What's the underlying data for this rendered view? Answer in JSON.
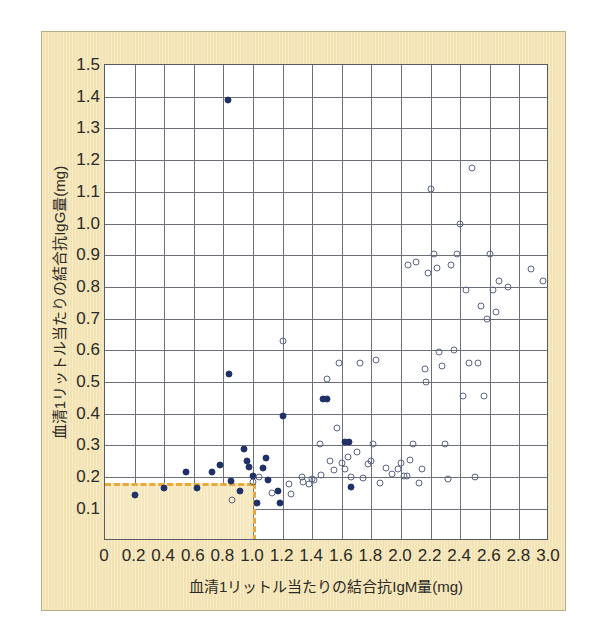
{
  "chart_data": {
    "type": "scatter",
    "title": "",
    "xlabel": "血清1リットル当たりの結合抗IgM量(mg)",
    "ylabel": "血清1リットル当たりの結合抗IgG量(mg)",
    "xlim": [
      0.0,
      3.0
    ],
    "ylim": [
      0.0,
      1.5
    ],
    "xticks": [
      "0",
      "0.2",
      "0.4",
      "0.6",
      "0.8",
      "1.0",
      "1.2",
      "1.4",
      "1.6",
      "1.8",
      "2.0",
      "2.2",
      "2.4",
      "2.6",
      "2.8",
      "3.0"
    ],
    "xtick_values": [
      0.0,
      0.2,
      0.4,
      0.6,
      0.8,
      1.0,
      1.2,
      1.4,
      1.6,
      1.8,
      2.0,
      2.2,
      2.4,
      2.6,
      2.8,
      3.0
    ],
    "yticks": [
      "0.1",
      "0.2",
      "0.3",
      "0.4",
      "0.5",
      "0.6",
      "0.7",
      "0.8",
      "0.9",
      "1.0",
      "1.1",
      "1.2",
      "1.3",
      "1.4",
      "1.5"
    ],
    "ytick_values": [
      0.1,
      0.2,
      0.3,
      0.4,
      0.5,
      0.6,
      0.7,
      0.8,
      0.9,
      1.0,
      1.1,
      1.2,
      1.3,
      1.4,
      1.5
    ],
    "grid": true,
    "grid_color": "#6b7078",
    "plot_bgcolor": "#ffffff",
    "paper_bgcolor": "#f4e3b2",
    "legend": [],
    "annotations": {
      "threshold_region": {
        "x_max": 1.0,
        "y_max": 0.18,
        "line_color": "#e8a93a",
        "fill_color": "#f6e6bb",
        "line_style": "dashed"
      }
    },
    "series": [
      {
        "name": "filled",
        "marker": "filled-circle",
        "color": "#1f3168",
        "points": [
          [
            0.2,
            0.145
          ],
          [
            0.4,
            0.165
          ],
          [
            0.55,
            0.215
          ],
          [
            0.62,
            0.165
          ],
          [
            0.72,
            0.215
          ],
          [
            0.78,
            0.237
          ],
          [
            0.83,
            1.39
          ],
          [
            0.84,
            0.525
          ],
          [
            0.85,
            0.188
          ],
          [
            0.91,
            0.155
          ],
          [
            0.94,
            0.29
          ],
          [
            0.96,
            0.25
          ],
          [
            0.97,
            0.232
          ],
          [
            1.0,
            0.205
          ],
          [
            1.03,
            0.118
          ],
          [
            1.07,
            0.228
          ],
          [
            1.09,
            0.26
          ],
          [
            1.1,
            0.192
          ],
          [
            1.17,
            0.155
          ],
          [
            1.18,
            0.118
          ],
          [
            1.2,
            0.392
          ],
          [
            1.47,
            0.445
          ],
          [
            1.5,
            0.445
          ],
          [
            1.62,
            0.312
          ],
          [
            1.65,
            0.312
          ],
          [
            1.66,
            0.168
          ]
        ]
      },
      {
        "name": "open",
        "marker": "open-circle",
        "color": "#5a6285",
        "points": [
          [
            0.86,
            0.128
          ],
          [
            1.0,
            0.185
          ],
          [
            1.04,
            0.2
          ],
          [
            1.13,
            0.15
          ],
          [
            1.2,
            0.63
          ],
          [
            1.24,
            0.178
          ],
          [
            1.26,
            0.148
          ],
          [
            1.33,
            0.2
          ],
          [
            1.34,
            0.185
          ],
          [
            1.38,
            0.178
          ],
          [
            1.4,
            0.195
          ],
          [
            1.41,
            0.19
          ],
          [
            1.45,
            0.305
          ],
          [
            1.46,
            0.208
          ],
          [
            1.5,
            0.508
          ],
          [
            1.52,
            0.252
          ],
          [
            1.55,
            0.222
          ],
          [
            1.57,
            0.355
          ],
          [
            1.58,
            0.56
          ],
          [
            1.6,
            0.245
          ],
          [
            1.62,
            0.225
          ],
          [
            1.64,
            0.262
          ],
          [
            1.66,
            0.2
          ],
          [
            1.7,
            0.278
          ],
          [
            1.72,
            0.56
          ],
          [
            1.74,
            0.198
          ],
          [
            1.78,
            0.24
          ],
          [
            1.8,
            0.252
          ],
          [
            1.81,
            0.305
          ],
          [
            1.83,
            0.57
          ],
          [
            1.86,
            0.182
          ],
          [
            1.9,
            0.23
          ],
          [
            1.94,
            0.21
          ],
          [
            1.98,
            0.225
          ],
          [
            2.0,
            0.245
          ],
          [
            2.02,
            0.205
          ],
          [
            2.04,
            0.202
          ],
          [
            2.05,
            0.87
          ],
          [
            2.06,
            0.255
          ],
          [
            2.08,
            0.305
          ],
          [
            2.1,
            0.88
          ],
          [
            2.12,
            0.182
          ],
          [
            2.14,
            0.225
          ],
          [
            2.16,
            0.54
          ],
          [
            2.17,
            0.5
          ],
          [
            2.18,
            0.845
          ],
          [
            2.2,
            1.11
          ],
          [
            2.22,
            0.905
          ],
          [
            2.24,
            0.86
          ],
          [
            2.26,
            0.595
          ],
          [
            2.28,
            0.55
          ],
          [
            2.3,
            0.305
          ],
          [
            2.32,
            0.195
          ],
          [
            2.34,
            0.87
          ],
          [
            2.36,
            0.6
          ],
          [
            2.38,
            0.905
          ],
          [
            2.4,
            1.0
          ],
          [
            2.42,
            0.455
          ],
          [
            2.44,
            0.79
          ],
          [
            2.46,
            0.56
          ],
          [
            2.48,
            1.175
          ],
          [
            2.5,
            0.2
          ],
          [
            2.52,
            0.56
          ],
          [
            2.54,
            0.74
          ],
          [
            2.56,
            0.455
          ],
          [
            2.58,
            0.7
          ],
          [
            2.6,
            0.905
          ],
          [
            2.62,
            0.79
          ],
          [
            2.64,
            0.72
          ],
          [
            2.66,
            0.82
          ],
          [
            2.72,
            0.8
          ],
          [
            2.88,
            0.855
          ],
          [
            2.96,
            0.82
          ]
        ]
      }
    ]
  }
}
